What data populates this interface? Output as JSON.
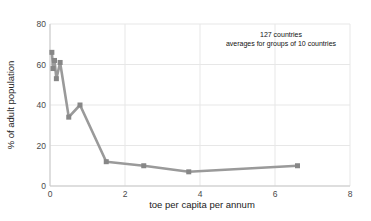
{
  "figure": {
    "width": 371,
    "height": 221,
    "background": "#ffffff"
  },
  "chart_data": {
    "type": "line",
    "title": "",
    "xlabel": "toe per capita per annum",
    "ylabel": "% of adult population",
    "annotation": {
      "line1": "127 countries",
      "line2": "averages for groups of 10 countries"
    },
    "x": [
      0.05,
      0.08,
      0.12,
      0.17,
      0.27,
      0.5,
      0.8,
      1.5,
      2.5,
      3.7,
      6.6
    ],
    "y": [
      66,
      58,
      62,
      53,
      61,
      34,
      40,
      12,
      10,
      7,
      10
    ],
    "xlim": [
      0,
      8
    ],
    "ylim": [
      0,
      80
    ],
    "xticks": [
      0,
      2,
      4,
      6,
      8
    ],
    "yticks": [
      0,
      20,
      40,
      60,
      80
    ],
    "grid": true,
    "legend": "none",
    "line_color": "#9a9a9a",
    "marker": "square",
    "marker_color": "#878787",
    "marker_size": 5,
    "line_width": 2.6,
    "grid_color": "#e7e7e7",
    "spine_color": "#c9c9c9",
    "tick_color": "#4a4a4a",
    "text_color": "#222222"
  }
}
